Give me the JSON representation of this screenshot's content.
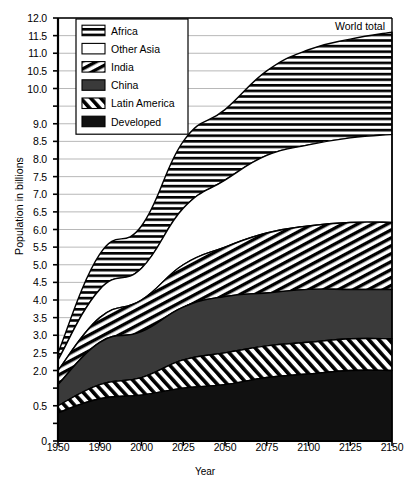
{
  "chart_data": {
    "type": "area",
    "stacked": true,
    "title": "",
    "xlabel": "Year",
    "ylabel": "Population in billions",
    "annotation": "World total",
    "grid": true,
    "legend_position": "top-left",
    "x": [
      "1950",
      "1990",
      "2000",
      "2025",
      "2050",
      "2075",
      "2100",
      "2125",
      "2150"
    ],
    "xtick_labels": [
      "1950",
      "1990",
      "2000",
      "2025",
      "2050",
      "2075",
      "2100",
      "2125",
      "2150"
    ],
    "ylim": [
      0,
      12.0
    ],
    "ytick_labels": [
      "12.0",
      "11.5",
      "11.0",
      "10.5",
      "10.0",
      "9.0",
      "8.5",
      "8.0",
      "7.5",
      "7.0",
      "6.5",
      "6.0",
      "5.5",
      "5.0",
      "4.5",
      "4.0",
      "3.5",
      "3.0",
      "2.5",
      "2.0",
      "0.5",
      "0"
    ],
    "ytick_values": [
      12.0,
      11.5,
      11.0,
      10.5,
      10.0,
      9.5,
      9.0,
      8.5,
      8.0,
      7.5,
      7.0,
      6.5,
      6.0,
      5.5,
      5.0,
      4.5,
      4.0,
      3.5,
      3.0,
      2.5,
      2.0,
      1.5,
      1.0,
      0.5,
      0.0
    ],
    "series": [
      {
        "name": "Developed",
        "pattern": "solid-black",
        "values": [
          0.8,
          1.2,
          1.3,
          1.5,
          1.6,
          1.8,
          1.9,
          2.0,
          2.0
        ]
      },
      {
        "name": "Latin America",
        "pattern": "diagonal-forward",
        "values": [
          0.2,
          0.4,
          0.5,
          0.8,
          0.9,
          0.9,
          0.9,
          0.9,
          0.9
        ]
      },
      {
        "name": "China",
        "pattern": "solid-dark-gray",
        "values": [
          0.6,
          1.2,
          1.3,
          1.5,
          1.6,
          1.5,
          1.5,
          1.4,
          1.4
        ]
      },
      {
        "name": "India",
        "pattern": "diagonal-back",
        "values": [
          0.4,
          0.7,
          0.9,
          1.2,
          1.4,
          1.7,
          1.8,
          1.9,
          1.9
        ]
      },
      {
        "name": "Other Asia",
        "pattern": "white",
        "values": [
          0.3,
          0.8,
          0.9,
          1.6,
          1.9,
          2.2,
          2.3,
          2.4,
          2.5
        ]
      },
      {
        "name": "Africa",
        "pattern": "horizontal-lines",
        "values": [
          0.2,
          1.0,
          1.2,
          1.9,
          2.0,
          2.4,
          2.7,
          2.8,
          2.9
        ]
      }
    ],
    "cumulative_tops": {
      "Developed": [
        0.8,
        1.2,
        1.3,
        1.5,
        1.6,
        1.8,
        1.9,
        2.0,
        2.0
      ],
      "Latin America": [
        1.0,
        1.6,
        1.8,
        2.3,
        2.5,
        2.7,
        2.8,
        2.9,
        2.9
      ],
      "China": [
        1.6,
        2.8,
        3.1,
        3.8,
        4.1,
        4.2,
        4.3,
        4.3,
        4.3
      ],
      "India": [
        2.0,
        3.5,
        4.0,
        5.0,
        5.5,
        5.9,
        6.1,
        6.2,
        6.2
      ],
      "Other Asia": [
        2.3,
        4.3,
        4.9,
        6.6,
        7.4,
        8.1,
        8.4,
        8.6,
        8.7
      ],
      "Africa": [
        2.5,
        5.3,
        6.1,
        8.5,
        9.4,
        10.5,
        11.1,
        11.4,
        11.6
      ]
    },
    "world_total": [
      2.5,
      5.3,
      6.1,
      8.5,
      9.4,
      10.5,
      11.1,
      11.4,
      11.6
    ],
    "legend": [
      {
        "label": "Africa",
        "pattern": "horizontal-lines"
      },
      {
        "label": "Other Asia",
        "pattern": "white"
      },
      {
        "label": "India",
        "pattern": "diagonal-back"
      },
      {
        "label": "China",
        "pattern": "solid-dark-gray"
      },
      {
        "label": "Latin America",
        "pattern": "diagonal-forward"
      },
      {
        "label": "Developed",
        "pattern": "solid-black"
      }
    ],
    "colors": {
      "solid_black": "#111111",
      "solid_dark_gray": "#3a3a3a",
      "white": "#ffffff",
      "line": "#000000",
      "grid": "#9a9a9a"
    }
  }
}
